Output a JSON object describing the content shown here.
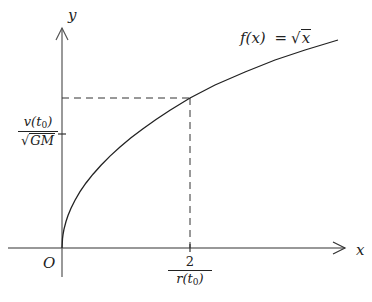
{
  "diagram": {
    "axes": {
      "x_label": "x",
      "y_label": "y",
      "origin_label": "O"
    },
    "function_label": {
      "lhs": "f(x)",
      "eq": "=",
      "rhs_radicand": "x",
      "rhs_prefix": "√"
    },
    "y_tick_label": {
      "numerator": "v(t",
      "numerator_sub": "0",
      "numerator_close": ")",
      "denominator_prefix": "√",
      "denominator": "GM"
    },
    "x_tick_label": {
      "numerator": "2",
      "denominator": "r(t",
      "denominator_sub": "0",
      "denominator_close": ")"
    },
    "colors": {
      "line": "#222222",
      "axis": "#444444",
      "background": "#ffffff"
    }
  }
}
